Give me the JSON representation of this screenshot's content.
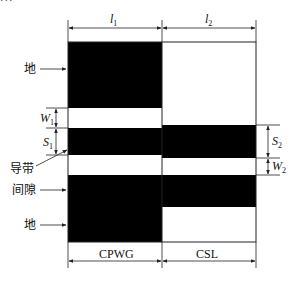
{
  "caption_fragment": "...",
  "diagram": {
    "type": "CPWG-to-CSL transition layout",
    "dimensions": {
      "top_left": {
        "symbol": "l",
        "subscript": "1"
      },
      "top_right": {
        "symbol": "l",
        "subscript": "2"
      },
      "left_gap": {
        "symbol": "W",
        "subscript": "1"
      },
      "left_strip": {
        "symbol": "S",
        "subscript": "1"
      },
      "right_strip": {
        "symbol": "S",
        "subscript": "2"
      },
      "right_gap": {
        "symbol": "W",
        "subscript": "2"
      }
    },
    "callouts": {
      "ground_top": "地",
      "conductor_strip": "导带",
      "gap": "间隙",
      "ground_bottom": "地"
    },
    "sections": {
      "left": "CPWG",
      "right": "CSL"
    },
    "colors": {
      "metal": "#000000",
      "substrate": "#ffffff",
      "line": "#222222"
    }
  }
}
